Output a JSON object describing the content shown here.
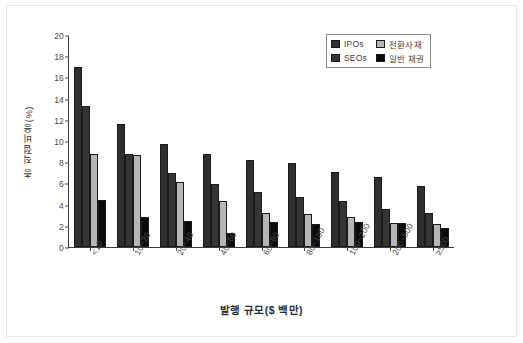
{
  "chart_data": {
    "type": "bar",
    "title": "",
    "subtitle": "",
    "xlabel": "발행 규모($ 백만)",
    "ylabel": "총 직접비용(%)",
    "ylim": [
      0,
      20
    ],
    "yticks": [
      0,
      2,
      4,
      6,
      8,
      10,
      12,
      14,
      16,
      18,
      20
    ],
    "grid": false,
    "legend_position": "top-right",
    "categories": [
      "<10",
      "10~20",
      "20~40",
      "40~60",
      "60~80",
      "80~100",
      "100~200",
      "200~500",
      "≥500"
    ],
    "series": [
      {
        "name": "IPOs",
        "color": "#2f2f2f",
        "values": [
          17.0,
          11.6,
          9.7,
          8.75,
          8.25,
          7.95,
          7.1,
          6.6,
          5.8
        ]
      },
      {
        "name": "SEOs",
        "color": "#353535",
        "values": [
          13.3,
          8.75,
          7.0,
          5.9,
          5.2,
          4.75,
          4.3,
          3.55,
          3.25
        ]
      },
      {
        "name": "전환사채",
        "color": "#b6b6b6",
        "values": [
          8.8,
          8.65,
          6.1,
          4.35,
          3.25,
          3.1,
          2.8,
          2.25,
          2.15
        ]
      },
      {
        "name": "일반 채권",
        "color": "#0a0a0a",
        "values": [
          4.4,
          2.8,
          2.45,
          1.35,
          2.35,
          2.2,
          2.35,
          2.25,
          1.75
        ]
      }
    ]
  },
  "legend": {
    "items": [
      {
        "label": "IPOs"
      },
      {
        "label": "전환사채"
      },
      {
        "label": "SEOs"
      },
      {
        "label": "일반 채권"
      }
    ]
  }
}
